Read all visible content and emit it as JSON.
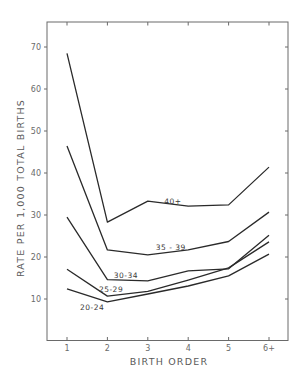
{
  "chart_data": {
    "type": "line",
    "title": "",
    "xlabel": "BIRTH ORDER",
    "ylabel": "RATE PER 1,000 TOTAL BIRTHS",
    "x": [
      1,
      2,
      3,
      4,
      5,
      6
    ],
    "x_tick_labels": [
      "1",
      "2",
      "3",
      "4",
      "5",
      "6+"
    ],
    "y_ticks": [
      10,
      20,
      30,
      40,
      50,
      60,
      70
    ],
    "ylim": [
      0,
      76
    ],
    "xlim": [
      0.5,
      6.45
    ],
    "grid": false,
    "legend": "inline labels on lines",
    "series": [
      {
        "name": "40+",
        "values": [
          68.5,
          28.3,
          33.3,
          32.1,
          32.4,
          41.4
        ],
        "label_pos": [
          3.62,
          33.4
        ]
      },
      {
        "name": "35 - 39",
        "values": [
          46.4,
          21.7,
          20.5,
          21.7,
          23.7,
          30.7
        ],
        "label_pos": [
          3.57,
          22.4
        ]
      },
      {
        "name": "30-34",
        "values": [
          29.5,
          14.6,
          14.3,
          16.7,
          17.2,
          25.2
        ],
        "label_pos": [
          2.46,
          15.6
        ]
      },
      {
        "name": "25-29",
        "values": [
          17.1,
          10.7,
          11.8,
          14.5,
          17.4,
          23.6
        ],
        "label_pos": [
          2.09,
          12.5
        ]
      },
      {
        "name": "20-24",
        "values": [
          12.4,
          9.3,
          11.2,
          13.1,
          15.5,
          20.7
        ],
        "label_pos": [
          1.62,
          8.2
        ]
      }
    ]
  }
}
